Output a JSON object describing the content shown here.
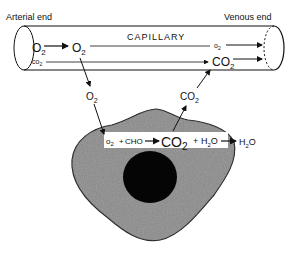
{
  "capillary": {
    "title": "CAPILLARY",
    "arterial_end": "Arterial end",
    "venous_end": "Venous end",
    "o2_in": "O",
    "o2_mid": "O",
    "o2_out": "o",
    "co2_in": "co",
    "co2_out": "CO",
    "sub2": "2"
  },
  "exchange": {
    "o2_to_cell": "O",
    "co2_from_cell": "CO",
    "sub2": "2"
  },
  "reaction": {
    "o2": "o",
    "plus1": "+",
    "cho": "CHO",
    "co2": "CO",
    "plus2": "+",
    "h2o_h": "H",
    "h2o_o": "O",
    "out_h": "H",
    "out_o": "O",
    "sub2": "2"
  },
  "colors": {
    "line": "#111111",
    "cell_fill": "#8a8a8a",
    "nucleus": "#050505"
  }
}
